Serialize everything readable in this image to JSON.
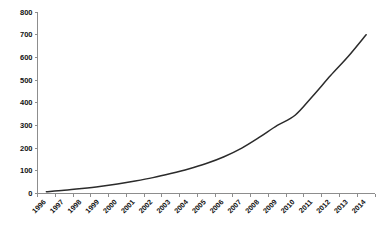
{
  "chart_data": {
    "type": "line",
    "title": "",
    "subtitle": "",
    "xlabel": "",
    "ylabel": "",
    "categories": [
      "1996",
      "1997",
      "1998",
      "1999",
      "2000",
      "2001",
      "2002",
      "2003",
      "2004",
      "2005",
      "2006",
      "2007",
      "2008",
      "2009",
      "2010",
      "2011",
      "2012",
      "2013",
      "2014"
    ],
    "values": [
      8,
      14,
      22,
      31,
      42,
      55,
      70,
      88,
      108,
      132,
      162,
      200,
      248,
      300,
      345,
      430,
      520,
      605,
      700
    ],
    "series": [
      {
        "name": "cumulative total",
        "values": [
          8,
          14,
          22,
          31,
          42,
          55,
          70,
          88,
          108,
          132,
          162,
          200,
          248,
          300,
          345,
          430,
          520,
          605,
          700
        ]
      }
    ],
    "ylim": [
      0,
      800
    ],
    "ytick_values": [
      0,
      100,
      200,
      300,
      400,
      500,
      600,
      700,
      800
    ],
    "ytick_labels": [
      "0",
      "100",
      "200",
      "300",
      "400",
      "500",
      "600",
      "700",
      "800"
    ],
    "xtick_labels": [
      "1996",
      "1997",
      "1998",
      "1999",
      "2000",
      "2001",
      "2002",
      "2003",
      "2004",
      "2005",
      "2006",
      "2007",
      "2008",
      "2009",
      "2010",
      "2011",
      "2012",
      "2013",
      "2014"
    ],
    "grid": false,
    "legend": false,
    "legend_position": "none",
    "annotations": [],
    "colors": {
      "line": "#2b2b2b",
      "axis": "#8d8d8d",
      "text": "#111111",
      "background": "#ffffff"
    },
    "xtick_rotation_deg": -45
  }
}
